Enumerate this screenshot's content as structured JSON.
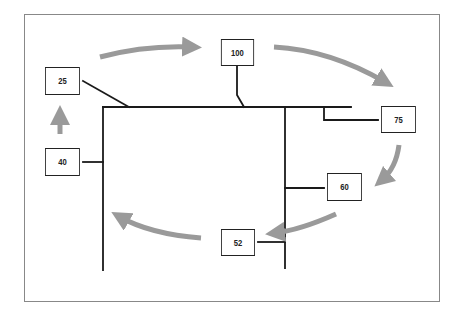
{
  "diagram": {
    "type": "bus-network-cycle",
    "frame": {
      "x": 24,
      "y": 14,
      "width": 415,
      "height": 287,
      "border_color": "#888888"
    },
    "colors": {
      "line": "#1a1a1a",
      "arrow": "#9a9a9a",
      "node_border": "#222222",
      "text": "#222222"
    },
    "nodes": [
      {
        "id": "n25",
        "label": "25",
        "x": 42,
        "y": 67,
        "w": 41,
        "h": 28
      },
      {
        "id": "n100",
        "label": "100",
        "x": 218,
        "y": 39,
        "w": 39,
        "h": 27
      },
      {
        "id": "n75",
        "label": "75",
        "x": 378,
        "y": 106,
        "w": 41,
        "h": 27
      },
      {
        "id": "n60",
        "label": "60",
        "x": 324,
        "y": 173,
        "w": 41,
        "h": 28
      },
      {
        "id": "n52",
        "label": "52",
        "x": 218,
        "y": 229,
        "w": 40,
        "h": 27
      },
      {
        "id": "n40",
        "label": "40",
        "x": 42,
        "y": 148,
        "w": 41,
        "h": 28
      }
    ],
    "cycle_order": [
      "40",
      "25",
      "100",
      "75",
      "60",
      "52"
    ]
  }
}
